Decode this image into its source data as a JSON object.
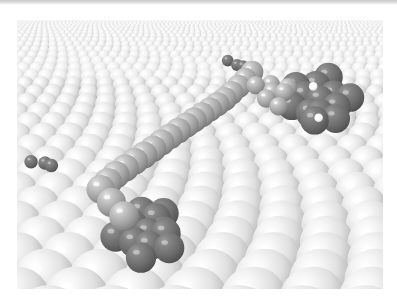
{
  "figure": {
    "domain": "Natural-Image",
    "kind": "scientific-rendering",
    "view": "low-angle perspective looking across the surface toward a high horizon",
    "rendering": "ray-traced spheres with specular highlights, light from upper-left",
    "palette": {
      "page_background": "#ffffff",
      "top_band": "#c9c9c9",
      "substrate_light": "#f2f2f2",
      "substrate_mid": "#d8d8d8",
      "substrate_shadow": "#9a9a9a",
      "substrate_crevice": "#6f6f6f",
      "adsorbate_medium": "#a8a8a8",
      "adsorbate_medium_shadow": "#7e7e7e",
      "adsorbate_dark": "#6d6d6d",
      "adsorbate_dark_shadow": "#4b4b4b",
      "highlight_white": "#ffffff",
      "specular": "#ffffff"
    },
    "frame": {
      "x": 17,
      "y": 10,
      "width": 366,
      "height": 279,
      "margin_color": "#ffffff"
    }
  },
  "scene_data": {
    "type": "3d-sphere-packing",
    "substrate": {
      "name": "close-packed metal surface",
      "lattice": "hexagonal close packed (111) terrace",
      "rows_visible": 16,
      "perspective": "rows converge toward a vanishing point above the upper-right",
      "sphere_color": "#ececec",
      "sphere_shadow": "#9e9e9e",
      "horizon_y_fraction": 0.03,
      "foreground_sphere_radius_px": 34,
      "horizon_sphere_radius_px": 3
    },
    "adsorbates": [
      {
        "id": "dark-cluster-right",
        "label": "aromatic macrocycle (right)",
        "tone": "dark",
        "color": "#6d6d6d",
        "center": [
          320,
          100
        ],
        "approx_radius_px": 34,
        "atom_count": 13,
        "inner_highlight_atoms": 2,
        "inner_highlight_color": "#ffffff"
      },
      {
        "id": "dark-cluster-bottom-left",
        "label": "aromatic macrocycle (lower left)",
        "tone": "dark",
        "color": "#6d6d6d",
        "center": [
          148,
          233
        ],
        "approx_radius_px": 36,
        "atom_count": 12,
        "inner_highlight_atoms": 0
      },
      {
        "id": "dark-pair-left-edge",
        "label": "dark atom pair at left edge",
        "tone": "dark",
        "color": "#6d6d6d",
        "center": [
          45,
          163
        ],
        "approx_radius_px": 16,
        "atom_count": 3
      },
      {
        "id": "dark-pair-top-chain",
        "label": "dark atoms at top of chain",
        "tone": "dark",
        "color": "#6d6d6d",
        "center": [
          237,
          65
        ],
        "approx_radius_px": 14,
        "atom_count": 3
      },
      {
        "id": "medium-chain",
        "label": "alkyl / molecular chain bridging the macrocycles",
        "tone": "medium",
        "color": "#a8a8a8",
        "path": [
          [
            252,
            72
          ],
          [
            239,
            86
          ],
          [
            226,
            98
          ],
          [
            212,
            108
          ],
          [
            197,
            118
          ],
          [
            182,
            128
          ],
          [
            166,
            139
          ],
          [
            150,
            151
          ],
          [
            132,
            163
          ],
          [
            114,
            176
          ],
          [
            100,
            190
          ],
          [
            124,
            216
          ]
        ],
        "approx_atom_radius_px": 13,
        "atom_count": 22
      },
      {
        "id": "medium-patch-right",
        "label": "medium-tone atoms right of chain",
        "tone": "medium",
        "color": "#a8a8a8",
        "center": [
          272,
          92
        ],
        "approx_radius_px": 22,
        "atom_count": 7
      }
    ],
    "lighting": {
      "key_light_direction": "upper-left",
      "specular_highlight_offset": [
        -0.32,
        -0.38
      ],
      "ambient": "soft"
    }
  },
  "annotations": {
    "title": "",
    "caption": "",
    "labels": [],
    "scale_bar": null
  }
}
